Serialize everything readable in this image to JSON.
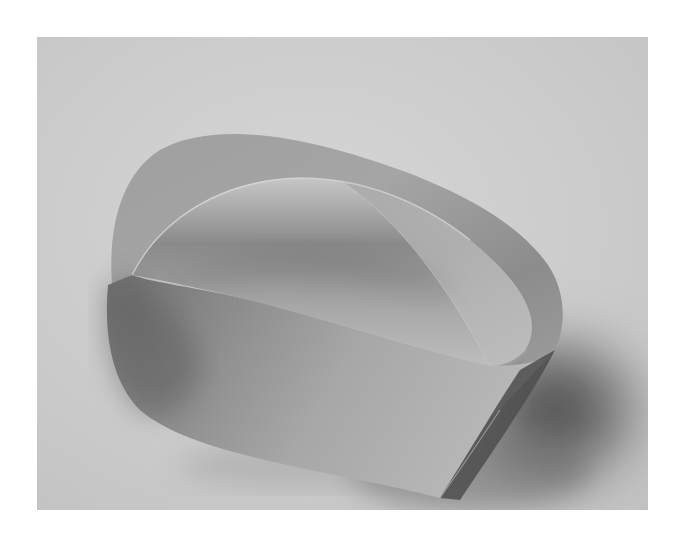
{
  "image": {
    "subject": "Möbius strip",
    "description": "Black-and-white photograph of a paper Möbius strip resting on a light gray surface, casting a soft shadow to the lower right",
    "colors": {
      "page_background": "#ffffff",
      "photo_background": "#c9c9c9",
      "strip_light": "#c4c4c4",
      "strip_mid": "#9a9a9a",
      "strip_dark": "#6a6a6a",
      "shadow": "#5a5a5a"
    },
    "photo_bounds": {
      "x": 37,
      "y": 37,
      "width": 611,
      "height": 473
    }
  }
}
